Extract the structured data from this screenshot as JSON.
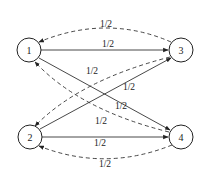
{
  "diagram": {
    "nodes": [
      {
        "id": "1",
        "label": "1",
        "x": 29,
        "y": 50
      },
      {
        "id": "3",
        "label": "3",
        "x": 181,
        "y": 50
      },
      {
        "id": "2",
        "label": "2",
        "x": 30,
        "y": 137
      },
      {
        "id": "4",
        "label": "4",
        "x": 181,
        "y": 137
      }
    ],
    "edges": [
      {
        "from": "1",
        "to": "3",
        "style": "solid",
        "label": "1/2"
      },
      {
        "from": "3",
        "to": "1",
        "style": "dashed",
        "label": "1/2"
      },
      {
        "from": "3",
        "to": "2",
        "style": "dashed",
        "label": "1/2"
      },
      {
        "from": "2",
        "to": "3",
        "style": "solid",
        "label": "1/2"
      },
      {
        "from": "1",
        "to": "4",
        "style": "solid",
        "label": "1/2"
      },
      {
        "from": "4",
        "to": "1",
        "style": "dashed",
        "label": "1/2"
      },
      {
        "from": "2",
        "to": "4",
        "style": "solid",
        "label": "1/2"
      },
      {
        "from": "4",
        "to": "2",
        "style": "dashed",
        "label": "1/2"
      }
    ]
  }
}
